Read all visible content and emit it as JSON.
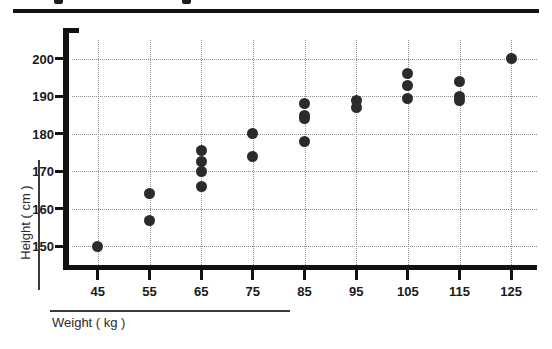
{
  "chart_data": {
    "type": "scatter",
    "title": "",
    "xlabel": "Weight ( kg )",
    "ylabel": "Height ( cm )",
    "xlim": [
      40,
      130
    ],
    "ylim": [
      145,
      205
    ],
    "xticks": [
      45,
      55,
      65,
      75,
      85,
      95,
      105,
      115,
      125
    ],
    "yticks": [
      150,
      160,
      170,
      180,
      190,
      200
    ],
    "grid": true,
    "legend": null,
    "marker_color": "#2b2b2b",
    "points": [
      {
        "x": 45,
        "y": 150
      },
      {
        "x": 55,
        "y": 164
      },
      {
        "x": 55,
        "y": 157
      },
      {
        "x": 65,
        "y": 175.5
      },
      {
        "x": 65,
        "y": 172.5
      },
      {
        "x": 65,
        "y": 170
      },
      {
        "x": 65,
        "y": 166
      },
      {
        "x": 75,
        "y": 180
      },
      {
        "x": 75,
        "y": 174
      },
      {
        "x": 85,
        "y": 188
      },
      {
        "x": 85,
        "y": 185
      },
      {
        "x": 85,
        "y": 184
      },
      {
        "x": 85,
        "y": 178
      },
      {
        "x": 95,
        "y": 189
      },
      {
        "x": 95,
        "y": 187
      },
      {
        "x": 105,
        "y": 196
      },
      {
        "x": 105,
        "y": 193
      },
      {
        "x": 105,
        "y": 189.5
      },
      {
        "x": 115,
        "y": 194
      },
      {
        "x": 115,
        "y": 190
      },
      {
        "x": 115,
        "y": 189
      },
      {
        "x": 125,
        "y": 200
      }
    ]
  },
  "axes": {
    "x_title": "Weight ( kg )",
    "y_title": "Height ( cm )"
  },
  "colors": {
    "marker": "#2b2b2b",
    "axis": "#111111",
    "grid": "#8c8c8c",
    "text": "#1a1a1a",
    "background": "#ffffff"
  }
}
